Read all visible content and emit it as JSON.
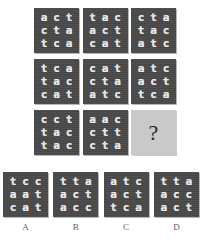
{
  "puzzle": {
    "type": "matrix-reasoning",
    "unknown_symbol": "?",
    "matrix": {
      "rows": 3,
      "cols": 3,
      "cells": [
        {
          "id": "cell-1-1",
          "rows": [
            [
              "a",
              "c",
              "t"
            ],
            [
              "c",
              "t",
              "a"
            ],
            [
              "t",
              "c",
              "a"
            ]
          ]
        },
        {
          "id": "cell-1-2",
          "rows": [
            [
              "t",
              "a",
              "c"
            ],
            [
              "a",
              "c",
              "t"
            ],
            [
              "c",
              "a",
              "t"
            ]
          ]
        },
        {
          "id": "cell-1-3",
          "rows": [
            [
              "c",
              "t",
              "a"
            ],
            [
              "t",
              "a",
              "c"
            ],
            [
              "a",
              "t",
              "c"
            ]
          ]
        },
        {
          "id": "cell-2-1",
          "rows": [
            [
              "t",
              "c",
              "a"
            ],
            [
              "t",
              "a",
              "c"
            ],
            [
              "c",
              "a",
              "t"
            ]
          ]
        },
        {
          "id": "cell-2-2",
          "rows": [
            [
              "c",
              "a",
              "t"
            ],
            [
              "c",
              "t",
              "a"
            ],
            [
              "a",
              "t",
              "c"
            ]
          ]
        },
        {
          "id": "cell-2-3",
          "rows": [
            [
              "a",
              "t",
              "c"
            ],
            [
              "a",
              "c",
              "t"
            ],
            [
              "t",
              "c",
              "a"
            ]
          ]
        },
        {
          "id": "cell-3-1",
          "rows": [
            [
              "c",
              "c",
              "t"
            ],
            [
              "t",
              "a",
              "c"
            ],
            [
              "t",
              "a",
              "c"
            ]
          ]
        },
        {
          "id": "cell-3-2",
          "rows": [
            [
              "a",
              "a",
              "c"
            ],
            [
              "c",
              "t",
              "t"
            ],
            [
              "c",
              "t",
              "a"
            ]
          ]
        },
        {
          "id": "cell-3-3",
          "unknown": true
        }
      ]
    },
    "options": [
      {
        "label": "A",
        "id": "option-a",
        "rows": [
          [
            "t",
            "c",
            "c"
          ],
          [
            "a",
            "a",
            "t"
          ],
          [
            "c",
            "a",
            "t"
          ]
        ]
      },
      {
        "label": "B",
        "id": "option-b",
        "rows": [
          [
            "t",
            "t",
            "a"
          ],
          [
            "a",
            "c",
            "t"
          ],
          [
            "a",
            "c",
            "c"
          ]
        ]
      },
      {
        "label": "C",
        "id": "option-c",
        "rows": [
          [
            "a",
            "t",
            "c"
          ],
          [
            "a",
            "c",
            "t"
          ],
          [
            "t",
            "c",
            "a"
          ]
        ]
      },
      {
        "label": "D",
        "id": "option-d",
        "rows": [
          [
            "t",
            "t",
            "a"
          ],
          [
            "a",
            "c",
            "c"
          ],
          [
            "a",
            "c",
            "t"
          ]
        ]
      }
    ],
    "colors": {
      "tile_background": "#4a4a4a",
      "tile_text": "#e9e9e9",
      "unknown_background": "#c9c9c9",
      "unknown_text": "#2a2a2a",
      "page_background": "#ffffff",
      "label_text": "#5d5d5d"
    }
  }
}
